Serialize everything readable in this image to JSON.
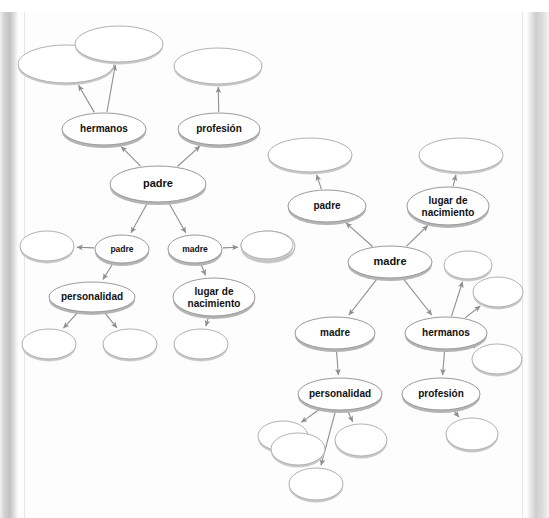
{
  "page": {
    "background_color": "#fdfdfd",
    "gutter_color": "#c2c2c2",
    "node_stroke_color": "#9a9a9a",
    "node_fill_color": "#ffffff",
    "shadow_color": "#b4b4b4",
    "arrow_color": "#8e8e8e",
    "top_cropped_text": ""
  },
  "diagrams": [
    {
      "id": "left-map",
      "name": "padre-concept-map",
      "root_label": "padre",
      "nodes": [
        {
          "id": "L1",
          "label": "",
          "cx": 66,
          "cy": 64,
          "rx": 48,
          "ry": 19,
          "filled": false,
          "size": "lg"
        },
        {
          "id": "L2",
          "label": "",
          "cx": 119,
          "cy": 44,
          "rx": 44,
          "ry": 18,
          "filled": false,
          "size": "lg"
        },
        {
          "id": "L3",
          "label": "hermanos",
          "cx": 104,
          "cy": 129,
          "rx": 42,
          "ry": 16,
          "filled": true,
          "size": "md"
        },
        {
          "id": "L4",
          "label": "",
          "cx": 218,
          "cy": 66,
          "rx": 44,
          "ry": 18,
          "filled": false,
          "size": "lg"
        },
        {
          "id": "L5",
          "label": "profesión",
          "cx": 219,
          "cy": 129,
          "rx": 41,
          "ry": 16,
          "filled": true,
          "size": "md"
        },
        {
          "id": "L6",
          "label": "padre",
          "cx": 158,
          "cy": 184,
          "rx": 48,
          "ry": 18,
          "filled": true,
          "size": "lg"
        },
        {
          "id": "L7",
          "label": "padre",
          "cx": 122,
          "cy": 249,
          "rx": 27,
          "ry": 14,
          "filled": true,
          "size": "sm"
        },
        {
          "id": "L8",
          "label": "madre",
          "cx": 195,
          "cy": 249,
          "rx": 27,
          "ry": 14,
          "filled": true,
          "size": "sm"
        },
        {
          "id": "L9",
          "label": "",
          "cx": 47,
          "cy": 246,
          "rx": 27,
          "ry": 15,
          "filled": false,
          "size": "sm"
        },
        {
          "id": "L10",
          "label": "",
          "cx": 268,
          "cy": 246,
          "rx": 27,
          "ry": 15,
          "filled": false,
          "size": "sm"
        },
        {
          "id": "L11",
          "label": "personalidad",
          "cx": 92,
          "cy": 297,
          "rx": 43,
          "ry": 15,
          "filled": true,
          "size": "md"
        },
        {
          "id": "L12",
          "label": "lugar de nacimiento",
          "cx": 214,
          "cy": 297,
          "rx": 41,
          "ry": 19,
          "filled": true,
          "size": "md"
        },
        {
          "id": "L13",
          "label": "",
          "cx": 49,
          "cy": 344,
          "rx": 27,
          "ry": 15,
          "filled": false,
          "size": "sm"
        },
        {
          "id": "L14",
          "label": "",
          "cx": 130,
          "cy": 344,
          "rx": 27,
          "ry": 15,
          "filled": false,
          "size": "sm"
        },
        {
          "id": "L15",
          "label": "",
          "cx": 201,
          "cy": 344,
          "rx": 27,
          "ry": 15,
          "filled": false,
          "size": "sm"
        }
      ],
      "edges": [
        {
          "from": "L6",
          "to": "L3",
          "arrow": true
        },
        {
          "from": "L6",
          "to": "L5",
          "arrow": true
        },
        {
          "from": "L3",
          "to": "L1",
          "arrow": true
        },
        {
          "from": "L3",
          "to": "L2",
          "arrow": true
        },
        {
          "from": "L5",
          "to": "L4",
          "arrow": true
        },
        {
          "from": "L6",
          "to": "L7",
          "arrow": true
        },
        {
          "from": "L6",
          "to": "L8",
          "arrow": true
        },
        {
          "from": "L7",
          "to": "L9",
          "arrow": true
        },
        {
          "from": "L8",
          "to": "L10",
          "arrow": true
        },
        {
          "from": "L7",
          "to": "L11",
          "arrow": true
        },
        {
          "from": "L8",
          "to": "L12",
          "arrow": true
        },
        {
          "from": "L11",
          "to": "L13",
          "arrow": true
        },
        {
          "from": "L11",
          "to": "L14",
          "arrow": true
        },
        {
          "from": "L12",
          "to": "L15",
          "arrow": true
        }
      ]
    },
    {
      "id": "right-map",
      "name": "madre-concept-map",
      "root_label": "madre",
      "nodes": [
        {
          "id": "R1",
          "label": "",
          "cx": 310,
          "cy": 155,
          "rx": 42,
          "ry": 17,
          "filled": false,
          "size": "lg"
        },
        {
          "id": "R2",
          "label": "padre",
          "cx": 327,
          "cy": 206,
          "rx": 39,
          "ry": 16,
          "filled": true,
          "size": "md"
        },
        {
          "id": "R3",
          "label": "",
          "cx": 461,
          "cy": 155,
          "rx": 42,
          "ry": 17,
          "filled": false,
          "size": "lg"
        },
        {
          "id": "R4",
          "label": "lugar de nacimiento",
          "cx": 448,
          "cy": 206,
          "rx": 41,
          "ry": 19,
          "filled": true,
          "size": "md"
        },
        {
          "id": "R5",
          "label": "madre",
          "cx": 390,
          "cy": 262,
          "rx": 42,
          "ry": 16,
          "filled": true,
          "size": "lg"
        },
        {
          "id": "R6",
          "label": "",
          "cx": 267,
          "cy": 245,
          "rx": 26,
          "ry": 14,
          "filled": false,
          "size": "sm"
        },
        {
          "id": "R7",
          "label": "",
          "cx": 468,
          "cy": 265,
          "rx": 24,
          "ry": 14,
          "filled": false,
          "size": "sm"
        },
        {
          "id": "R8",
          "label": "",
          "cx": 498,
          "cy": 292,
          "rx": 25,
          "ry": 15,
          "filled": false,
          "size": "sm"
        },
        {
          "id": "R9",
          "label": "madre",
          "cx": 335,
          "cy": 333,
          "rx": 40,
          "ry": 16,
          "filled": true,
          "size": "md"
        },
        {
          "id": "R10",
          "label": "hermanos",
          "cx": 446,
          "cy": 333,
          "rx": 41,
          "ry": 16,
          "filled": true,
          "size": "md"
        },
        {
          "id": "R11",
          "label": "",
          "cx": 497,
          "cy": 359,
          "rx": 25,
          "ry": 15,
          "filled": false,
          "size": "sm"
        },
        {
          "id": "R12",
          "label": "personalidad",
          "cx": 340,
          "cy": 394,
          "rx": 42,
          "ry": 16,
          "filled": true,
          "size": "md"
        },
        {
          "id": "R13",
          "label": "profesión",
          "cx": 441,
          "cy": 394,
          "rx": 39,
          "ry": 16,
          "filled": true,
          "size": "md"
        },
        {
          "id": "R14",
          "label": "",
          "cx": 472,
          "cy": 434,
          "rx": 26,
          "ry": 16,
          "filled": false,
          "size": "sm"
        },
        {
          "id": "R15",
          "label": "",
          "cx": 283,
          "cy": 436,
          "rx": 25,
          "ry": 15,
          "filled": false,
          "size": "sm"
        },
        {
          "id": "R16",
          "label": "",
          "cx": 298,
          "cy": 449,
          "rx": 27,
          "ry": 16,
          "filled": false,
          "size": "sm"
        },
        {
          "id": "R17",
          "label": "",
          "cx": 316,
          "cy": 484,
          "rx": 27,
          "ry": 16,
          "filled": false,
          "size": "sm"
        },
        {
          "id": "R18",
          "label": "",
          "cx": 361,
          "cy": 440,
          "rx": 26,
          "ry": 16,
          "filled": false,
          "size": "sm"
        }
      ],
      "edges": [
        {
          "from": "R5",
          "to": "R2",
          "arrow": true
        },
        {
          "from": "R5",
          "to": "R4",
          "arrow": true
        },
        {
          "from": "R2",
          "to": "R1",
          "arrow": true
        },
        {
          "from": "R4",
          "to": "R3",
          "arrow": true
        },
        {
          "from": "R5",
          "to": "R9",
          "arrow": true
        },
        {
          "from": "R5",
          "to": "R10",
          "arrow": true
        },
        {
          "from": "R9",
          "to": "R12",
          "arrow": true
        },
        {
          "from": "R10",
          "to": "R13",
          "arrow": true
        },
        {
          "from": "R10",
          "to": "R7",
          "arrow": true
        },
        {
          "from": "R10",
          "to": "R8",
          "arrow": true
        },
        {
          "from": "R10",
          "to": "R11",
          "arrow": true
        },
        {
          "from": "R13",
          "to": "R14",
          "arrow": true
        },
        {
          "from": "R12",
          "to": "R15",
          "arrow": true
        },
        {
          "from": "R12",
          "to": "R17",
          "arrow": true
        },
        {
          "from": "R12",
          "to": "R18",
          "arrow": true
        }
      ]
    }
  ],
  "labels_used": [
    "padre",
    "madre",
    "hermanos",
    "profesión",
    "personalidad",
    "lugar de nacimiento"
  ]
}
